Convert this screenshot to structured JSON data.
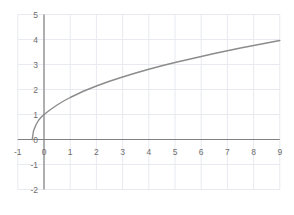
{
  "chart_data": {
    "type": "line",
    "title": "",
    "subtitle": "",
    "xlabel": "",
    "ylabel": "",
    "xlim": [
      -1,
      9
    ],
    "ylim": [
      -2,
      5
    ],
    "xticks": [
      -1,
      0,
      1,
      2,
      3,
      4,
      5,
      6,
      7,
      8,
      9
    ],
    "xtick_labels": [
      "-1",
      "0",
      "1",
      "2",
      "3",
      "4",
      "5",
      "6",
      "7",
      "8",
      "9"
    ],
    "yticks": [
      -2,
      -1,
      0,
      1,
      2,
      3,
      4,
      5
    ],
    "ytick_labels": [
      "-2",
      "-1",
      "0",
      "1",
      "2",
      "3",
      "4",
      "5"
    ],
    "grid": true,
    "grid_color": "#e8eaf0",
    "axis_color": "#808080",
    "series": [
      {
        "name": "curve",
        "color": "#8c8c8c",
        "line_width": 1.4,
        "x": [
          -0.45,
          -0.4,
          -0.3,
          -0.2,
          -0.1,
          0.0,
          0.25,
          0.5,
          0.75,
          1.0,
          1.5,
          2.0,
          2.5,
          3.0,
          3.5,
          4.0,
          4.5,
          5.0,
          5.5,
          6.0,
          6.5,
          7.0,
          7.5,
          8.0,
          8.5,
          9.0
        ],
        "y": [
          0.0,
          0.35,
          0.6,
          0.78,
          0.9,
          1.0,
          1.2,
          1.38,
          1.54,
          1.68,
          1.93,
          2.14,
          2.33,
          2.5,
          2.66,
          2.81,
          2.95,
          3.08,
          3.2,
          3.32,
          3.44,
          3.55,
          3.66,
          3.76,
          3.86,
          3.96
        ]
      }
    ],
    "legend": null,
    "legend_position": "none",
    "annotations": []
  },
  "axes": {
    "origin_label": "0",
    "x_axis_name": "x-axis",
    "y_axis_name": "y-axis"
  }
}
